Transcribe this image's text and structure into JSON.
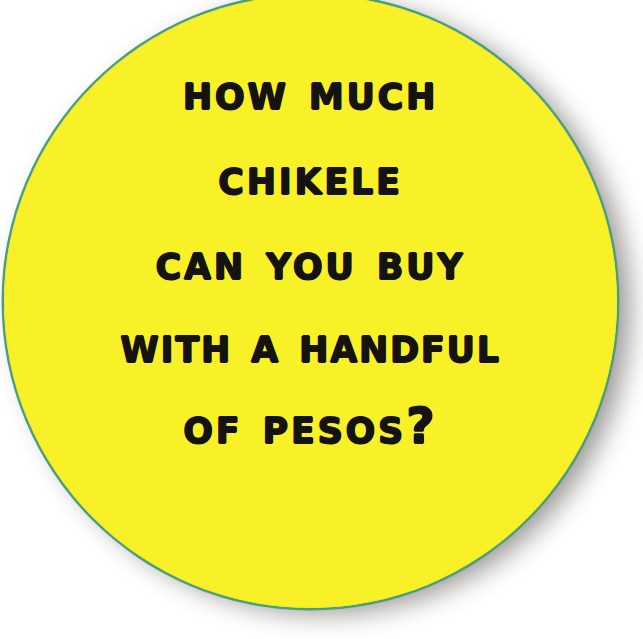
{
  "canvas": {
    "width": 643,
    "height": 639,
    "background_color": "#ffffff"
  },
  "sticker": {
    "shape": "circle",
    "fill_color": "#f9f128",
    "rim_color": "#4a9e7f",
    "shadow_color": "#605c58",
    "text_color": "#151310",
    "center_x": 310,
    "center_y": 301,
    "radius": 306
  },
  "headline": {
    "full_text": "HOW MUCH CHIKELE CAN YOU BUY WITH A HANDFUL OF PESOS?",
    "lines": [
      {
        "text": "How much"
      },
      {
        "text": "Chikele"
      },
      {
        "text": "can you buy"
      },
      {
        "text": "with a handful"
      },
      {
        "text": "of pesos?"
      }
    ]
  }
}
